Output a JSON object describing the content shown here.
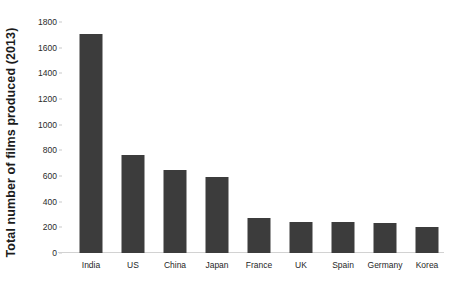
{
  "chart_data": {
    "type": "bar",
    "title": "",
    "xlabel": "",
    "ylabel": "Total number of films produced (2013)",
    "categories": [
      "India",
      "US",
      "China",
      "Japan",
      "France",
      "UK",
      "Spain",
      "Germany",
      "Korea"
    ],
    "values": [
      1710,
      765,
      650,
      595,
      270,
      240,
      240,
      230,
      205
    ],
    "ylim": [
      0,
      1800
    ],
    "ytick_labels": [
      "0",
      "200",
      "400",
      "600",
      "800",
      "1000",
      "1200",
      "1400",
      "1600",
      "1800"
    ],
    "ytick_values": [
      0,
      200,
      400,
      600,
      800,
      1000,
      1200,
      1400,
      1600,
      1800
    ],
    "grid": false,
    "legend": null,
    "bar_color": "#3c3c3c",
    "background_color": "#ffffff",
    "axis_color": "#d2d2d2"
  }
}
